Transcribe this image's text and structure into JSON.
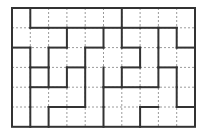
{
  "puzzle": {
    "type": "region-division-grid",
    "cols": 10,
    "rows": 6,
    "origin": {
      "x": 12,
      "y": 8
    },
    "cell_width": 18.3,
    "cell_height": 19.8,
    "colors": {
      "thick_line": "#333333",
      "dotted_line": "#9a9a9a",
      "background": "#ffffff"
    },
    "horizontal_thick": {
      "1": [
        1,
        2,
        3,
        4,
        5,
        6,
        7,
        8
      ],
      "2": [
        0,
        2,
        4,
        6,
        9
      ],
      "3": [
        1,
        3,
        6,
        8
      ],
      "4": [
        1,
        2,
        5,
        6,
        7
      ],
      "5": [
        2,
        3,
        7,
        9
      ]
    },
    "vertical_thick": {
      "0": [
        1,
        6
      ],
      "1": [
        3,
        5,
        6,
        8,
        9
      ],
      "2": [
        1,
        2,
        4,
        7,
        8
      ],
      "3": [
        1,
        2,
        3,
        4,
        5,
        6,
        8,
        9
      ],
      "4": [
        1,
        4,
        5,
        9
      ],
      "5": [
        1,
        2,
        5,
        7
      ]
    }
  }
}
